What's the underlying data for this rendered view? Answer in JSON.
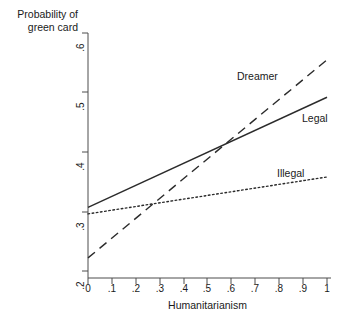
{
  "chart_data": {
    "type": "line",
    "title": "",
    "xlabel": "Humanitarianism",
    "ylabel": "Probability of\ngreen card",
    "xlim": [
      0,
      1
    ],
    "ylim": [
      0.2,
      0.6
    ],
    "grid": false,
    "legend_position": "inline-annotations",
    "xticks": [
      "0",
      ".1",
      ".2",
      ".3",
      ".4",
      ".5",
      ".6",
      ".7",
      ".8",
      ".9",
      "1"
    ],
    "xtick_values": [
      0,
      0.1,
      0.2,
      0.3,
      0.4,
      0.5,
      0.6,
      0.7,
      0.8,
      0.9,
      1
    ],
    "yticks": [
      ".2",
      ".3",
      ".4",
      ".5",
      ".6"
    ],
    "ytick_values": [
      0.2,
      0.3,
      0.4,
      0.5,
      0.6
    ],
    "x": [
      0,
      1
    ],
    "series": [
      {
        "name": "Dreamer",
        "label": "Dreamer",
        "style": "dashed",
        "color": "#2b2b2b",
        "values": [
          0.222,
          0.555
        ]
      },
      {
        "name": "Legal",
        "label": "Legal",
        "style": "solid",
        "color": "#2b2b2b",
        "values": [
          0.307,
          0.492
        ]
      },
      {
        "name": "Illegal",
        "label": "Illegal",
        "style": "dotted",
        "color": "#2b2b2b",
        "values": [
          0.296,
          0.358
        ]
      }
    ],
    "annotations": [
      {
        "text": "Dreamer",
        "x": 0.62,
        "y": 0.514
      },
      {
        "text": "Legal",
        "x": 0.9,
        "y": 0.445
      },
      {
        "text": "Illegal",
        "x": 0.79,
        "y": 0.353
      }
    ]
  },
  "axis": {
    "x_title": "Humanitarianism",
    "y_title_line1": "Probability of",
    "y_title_line2": "green card"
  }
}
